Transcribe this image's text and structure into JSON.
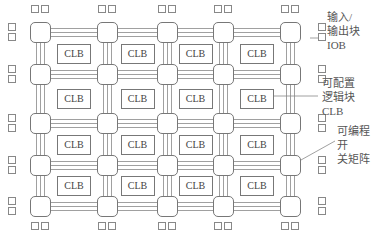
{
  "diagram": {
    "clb_label": "CLB",
    "clb_rows": 4,
    "clb_cols": 4,
    "labels": {
      "iob": [
        "输入/",
        "输出块",
        "IOB"
      ],
      "clb": [
        "可配置",
        "逻辑块",
        "CLB"
      ],
      "switch": [
        "可编程开",
        "关矩阵"
      ]
    },
    "colors": {
      "line": "#777777",
      "text": "#555555"
    }
  }
}
